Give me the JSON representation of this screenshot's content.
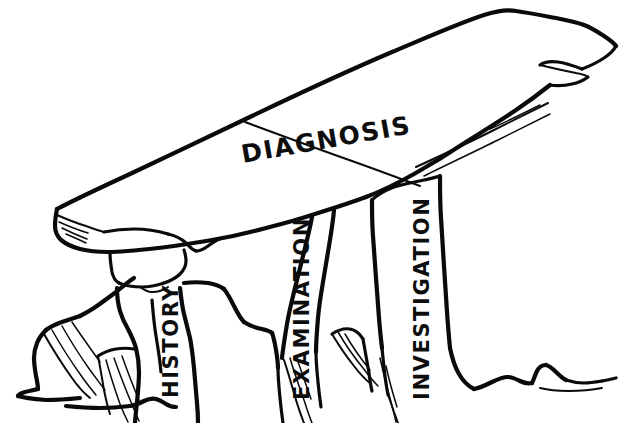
{
  "figure": {
    "style": "hand-drawn black ink line illustration on white background",
    "background_color": "#ffffff",
    "ink_color": "#0a0a0a"
  },
  "capstone": {
    "name": "capstone",
    "label": "DIAGNOSIS"
  },
  "supports": [
    {
      "name": "left-support-stone",
      "label": "HISTORY"
    },
    {
      "name": "middle-support-stone",
      "label": "EXAMINATION"
    },
    {
      "name": "right-support-stone",
      "label": "INVESTIGATION"
    }
  ]
}
